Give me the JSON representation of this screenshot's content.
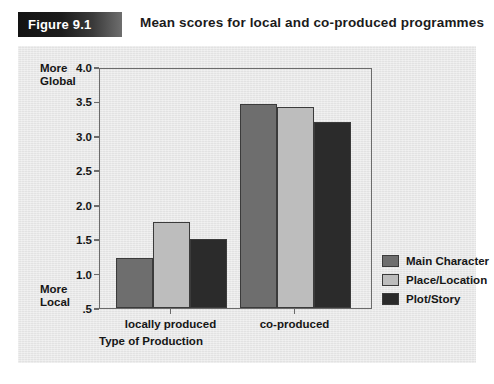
{
  "header": {
    "badge_label": "Figure 9.1",
    "title": "Mean scores for local and co-produced programmes"
  },
  "chart_data": {
    "type": "bar",
    "title": "Mean scores for local and co-produced programmes",
    "xlabel": "Type of Production",
    "ylabel": "",
    "categories": [
      "locally produced",
      "co-produced"
    ],
    "series": [
      {
        "name": "Main Character",
        "color": "#6e6e6e",
        "values": [
          1.22,
          3.47
        ]
      },
      {
        "name": "Place/Location",
        "color": "#bdbdbd",
        "values": [
          1.75,
          3.42
        ]
      },
      {
        "name": "Plot/Story",
        "color": "#2b2b2b",
        "values": [
          1.5,
          3.2
        ]
      }
    ],
    "ylim": [
      0.5,
      4.0
    ],
    "yticks": [
      "4.0",
      "3.5",
      "3.0",
      "2.5",
      "2.0",
      "1.5",
      "1.0",
      ".5"
    ],
    "ytick_values": [
      4.0,
      3.5,
      3.0,
      2.5,
      2.0,
      1.5,
      1.0,
      0.5
    ],
    "y_axis_annotations": {
      "top": "More\nGlobal",
      "top_line1": "More",
      "top_line2": "Global",
      "bottom_line1": "More",
      "bottom_line2": "Local"
    },
    "grid": false,
    "legend_position": "right"
  },
  "colors": {
    "main_character": "#6e6e6e",
    "place_location": "#bdbdbd",
    "plot_story": "#2b2b2b",
    "panel_background": "#e8e8e8",
    "axis": "#6b6b6b",
    "badge_dark": "#131313"
  }
}
